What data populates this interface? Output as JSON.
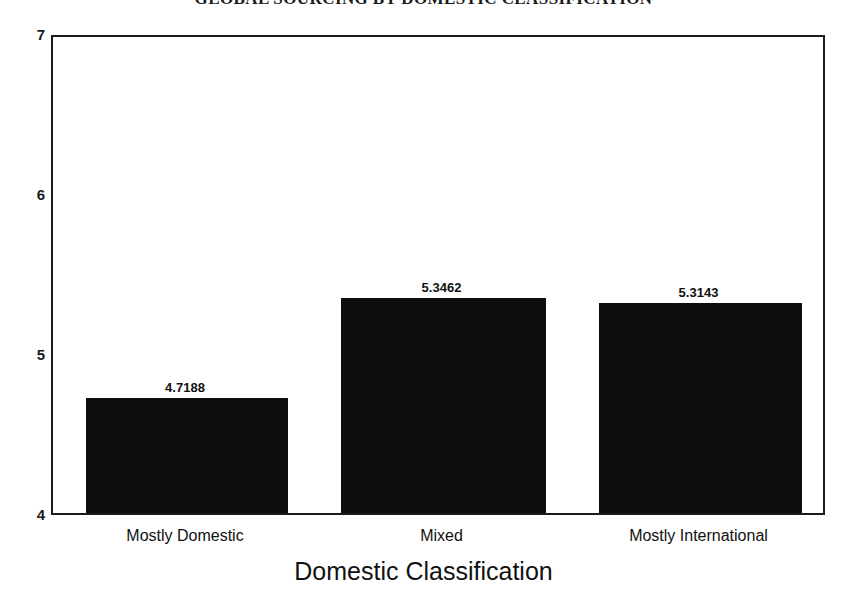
{
  "chart_data": {
    "type": "bar",
    "title": "GLOBAL SOURCING BY DOMESTIC CLASSIFICATION",
    "xlabel": "Domestic Classification",
    "ylabel": "",
    "categories": [
      "Mostly Domestic",
      "Mixed",
      "Mostly International"
    ],
    "values": [
      4.7188,
      5.3462,
      5.3143
    ],
    "value_labels": [
      "4.7188",
      "5.3462",
      "5.3143"
    ],
    "ylim": [
      4,
      7
    ],
    "yticks": [
      7,
      6,
      5,
      4
    ],
    "ytick_labels": [
      "7",
      "6",
      "5",
      "4"
    ],
    "grid": false,
    "legend": null,
    "bar_color": "#0d0d0d",
    "frame_color": "#1c1c1c",
    "background": "#ffffff"
  }
}
